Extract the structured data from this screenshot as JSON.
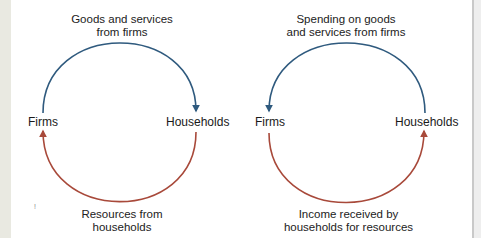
{
  "colors": {
    "product_flow": "#2f5a7e",
    "resource_flow": "#a8493a",
    "left_strip": "#e9e9e1"
  },
  "diagrams": [
    {
      "id": "real-flows",
      "top_label_line1": "Goods and services",
      "top_label_line2": "from firms",
      "left_node": "Firms",
      "right_node": "Households",
      "bottom_label_line1": "Resources from",
      "bottom_label_line2": "households",
      "top_arrow_direction": "firms-to-households",
      "bottom_arrow_direction": "households-to-firms"
    },
    {
      "id": "money-flows",
      "top_label_line1": "Spending on goods",
      "top_label_line2": "and services from firms",
      "left_node": "Firms",
      "right_node": "Households",
      "bottom_label_line1": "Income received by",
      "bottom_label_line2": "households for resources",
      "top_arrow_direction": "households-to-firms",
      "bottom_arrow_direction": "firms-to-households"
    }
  ],
  "stray_mark": "!"
}
